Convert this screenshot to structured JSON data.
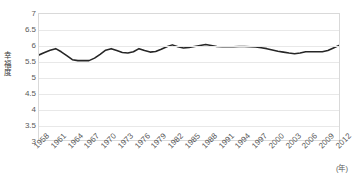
{
  "chart_data": {
    "type": "line",
    "title": "",
    "xlabel": "年",
    "ylabel": "幸福度",
    "ylim": [
      3,
      7
    ],
    "ytick_labels": [
      "7",
      "6.5",
      "6",
      "5.5",
      "5",
      "4.5",
      "4",
      "3.5",
      "3"
    ],
    "ytick_values": [
      7,
      6.5,
      6,
      5.5,
      5,
      4.5,
      4,
      3.5,
      3
    ],
    "grid": true,
    "legend": "none",
    "x_tick_labels": [
      "1958",
      "1961",
      "1964",
      "1967",
      "1970",
      "1973",
      "1976",
      "1979",
      "1982",
      "1985",
      "1988",
      "1991",
      "1994",
      "1997",
      "2000",
      "2003",
      "2006",
      "2009",
      "2012"
    ],
    "x_axis_unit": "(年)",
    "series": [
      {
        "name": "幸福度",
        "color": "#262626",
        "x": [
          1958,
          1959,
          1960,
          1961,
          1962,
          1963,
          1964,
          1965,
          1966,
          1967,
          1968,
          1969,
          1970,
          1971,
          1972,
          1973,
          1974,
          1975,
          1976,
          1977,
          1978,
          1979,
          1980,
          1981,
          1982,
          1983,
          1984,
          1985,
          1986,
          1987,
          1988,
          1989,
          1990,
          1991,
          1992,
          1993,
          1994,
          1995,
          1996,
          1997,
          1998,
          1999,
          2000,
          2001,
          2002,
          2003,
          2004,
          2005,
          2006,
          2007,
          2008,
          2009,
          2010,
          2011,
          2012
        ],
        "values": [
          5.7,
          5.78,
          5.85,
          5.9,
          5.8,
          5.68,
          5.55,
          5.52,
          5.52,
          5.52,
          5.6,
          5.72,
          5.85,
          5.9,
          5.84,
          5.78,
          5.76,
          5.8,
          5.9,
          5.84,
          5.79,
          5.81,
          5.88,
          5.96,
          6.02,
          5.96,
          5.92,
          5.94,
          5.97,
          6.0,
          6.03,
          6.0,
          5.97,
          5.96,
          5.96,
          5.96,
          5.97,
          5.97,
          5.96,
          5.95,
          5.93,
          5.9,
          5.86,
          5.82,
          5.79,
          5.76,
          5.74,
          5.76,
          5.8,
          5.8,
          5.8,
          5.8,
          5.84,
          5.92,
          6.0
        ]
      }
    ]
  },
  "axes": {
    "y_title_chars": [
      "幸",
      "福",
      "度"
    ]
  }
}
